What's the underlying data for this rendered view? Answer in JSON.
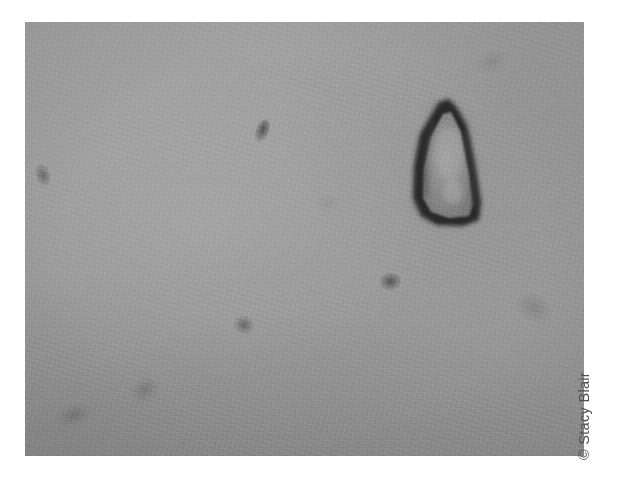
{
  "figure": {
    "kind": "photomicrograph",
    "alt_description": "Grayscale photomicrograph of a dark angular mineral grain on a uniform gray background with several small dark specks",
    "background_color": "#ffffff"
  },
  "micrograph": {
    "name": "photomicrograph-plate",
    "x": 25,
    "y": 22,
    "width": 559,
    "height": 434,
    "base_color": "#9a9a9a",
    "tone_light": "#a2a2a2",
    "tone_dark": "#8f8f8f"
  },
  "specimen": {
    "main_particle": {
      "name": "angular-grain",
      "shape": "angular triangular grain",
      "outline_color": "#2b2b2b",
      "interior_color": "#8d8d8d",
      "x": 368,
      "y": 58,
      "width": 120,
      "height": 160
    },
    "specks": [
      {
        "name": "speck-left-edge",
        "x": 42,
        "y": 175,
        "rx": 7,
        "ry": 11,
        "color": "#6f6f6f",
        "opacity": 0.55,
        "rotate": -18
      },
      {
        "name": "speck-upper-mid",
        "x": 262,
        "y": 130,
        "rx": 6,
        "ry": 11,
        "color": "#5e5e5e",
        "opacity": 0.62,
        "rotate": 22
      },
      {
        "name": "speck-center",
        "x": 400,
        "y": 283,
        "rx": 10,
        "ry": 8,
        "color": "#5f5f5f",
        "opacity": 0.6,
        "rotate": -8
      },
      {
        "name": "speck-lower-mid",
        "x": 252,
        "y": 325,
        "rx": 9,
        "ry": 8,
        "color": "#6b6b6b",
        "opacity": 0.5,
        "rotate": 12
      },
      {
        "name": "speck-lower-left",
        "x": 145,
        "y": 390,
        "rx": 13,
        "ry": 10,
        "color": "#767676",
        "opacity": 0.4,
        "rotate": -26
      },
      {
        "name": "speck-bottom-left",
        "x": 75,
        "y": 415,
        "rx": 17,
        "ry": 9,
        "color": "#757575",
        "opacity": 0.42,
        "rotate": -14
      },
      {
        "name": "speck-right",
        "x": 545,
        "y": 310,
        "rx": 16,
        "ry": 11,
        "color": "#7a7a7a",
        "opacity": 0.34,
        "rotate": 30
      },
      {
        "name": "speck-faint-upper",
        "x": 497,
        "y": 72,
        "rx": 14,
        "ry": 9,
        "color": "#828282",
        "opacity": 0.26,
        "rotate": -20
      },
      {
        "name": "speck-faint-mid",
        "x": 330,
        "y": 205,
        "rx": 10,
        "ry": 7,
        "color": "#858585",
        "opacity": 0.22,
        "rotate": 8
      }
    ]
  },
  "credit": {
    "name": "photo-credit",
    "text": "© Stacy Blair",
    "symbol": "©",
    "photographer": "Stacy Blair",
    "color": "#4f4f4f",
    "rotation_degrees": -90
  }
}
